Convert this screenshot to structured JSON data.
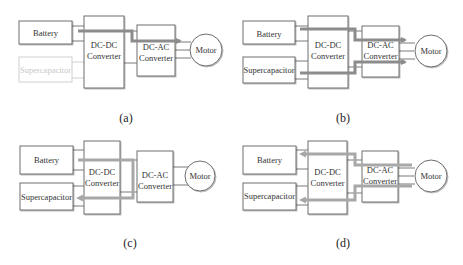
{
  "figure": {
    "panels": [
      {
        "id": "a",
        "caption": "(a)",
        "blocks": {
          "battery": "Battery",
          "supercapacitor": "Supercapacitor",
          "dcdc_line1": "DC-DC",
          "dcdc_line2": "Converter",
          "dcac_line1": "DC-AC",
          "dcac_line2": "Converter",
          "motor": "Motor"
        },
        "supercapacitor_state": "inactive (greyed out)",
        "power_flow": "Battery → DC-DC Converter → DC-AC Converter → Motor"
      },
      {
        "id": "b",
        "caption": "(b)",
        "blocks": {
          "battery": "Battery",
          "supercapacitor": "Supercapacitor",
          "dcdc_line1": "DC-DC",
          "dcdc_line2": "Converter",
          "dcac_line1": "DC-AC",
          "dcac_line2": "Converter",
          "motor": "Motor"
        },
        "power_flow": "Battery + Supercapacitor → DC-DC Converter → DC-AC Converter → Motor"
      },
      {
        "id": "c",
        "caption": "(c)",
        "blocks": {
          "battery": "Battery",
          "supercapacitor": "Supercapacitor",
          "dcdc_line1": "DC-DC",
          "dcdc_line2": "Converter",
          "dcac_line1": "DC-AC",
          "dcac_line2": "Converter",
          "motor": "Motor"
        },
        "power_flow": "Battery → DC-DC Converter → Supercapacitor (charging)"
      },
      {
        "id": "d",
        "caption": "(d)",
        "blocks": {
          "battery": "Battery",
          "supercapacitor": "Supercapacitor",
          "dcdc_line1": "DC-DC",
          "dcdc_line2": "Converter",
          "dcac_line1": "DC-AC",
          "dcac_line2": "Converter",
          "motor": "Motor"
        },
        "power_flow": "Motor → DC-AC Converter → DC-DC Converter → Battery + Supercapacitor (regenerative)"
      }
    ],
    "colors": {
      "box_stroke": "#6e6e6e",
      "faded": "#cfcfcf",
      "flow_arrow": "#8c8c8c",
      "text": "#333333"
    }
  }
}
